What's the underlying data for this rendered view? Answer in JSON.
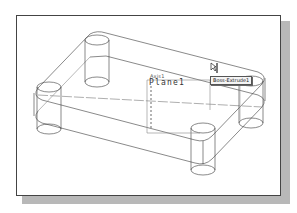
{
  "viewport": {
    "title": "3D wireframe model view",
    "view_mode": "wireframe-isometric"
  },
  "model": {
    "feature_tooltip": "Boss-Extrude1",
    "plane_label": "Plane1",
    "axis_label": "Axis1",
    "features": [
      "rounded rectangular base plate",
      "4 cylindrical bosses"
    ]
  },
  "colors": {
    "line": "#3a3a3a",
    "hidden_line": "#777777",
    "frame_border": "#444444",
    "shadow": "#b8b8b8",
    "background": "#ffffff"
  },
  "icons": {
    "cursor": "pointer-cursor-icon"
  }
}
